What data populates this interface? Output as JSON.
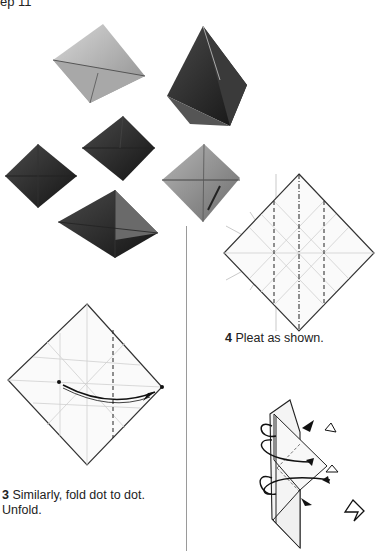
{
  "header": {
    "fragment": "ep 11"
  },
  "photos": {
    "alt_items": [
      "light-foil-octahedron",
      "dark-tall-pyramid",
      "dark-small-octahedron-left",
      "dark-small-octahedron-center",
      "grey-octahedron-right",
      "dark-large-octahedron-bottom"
    ]
  },
  "steps": [
    {
      "number": "3",
      "text": "Similarly, fold dot to dot.",
      "text2": "Unfold."
    },
    {
      "number": "4",
      "text": "Pleat as shown."
    }
  ],
  "colors": {
    "line": "#333333",
    "crease": "#aaaaaa",
    "divider": "#9a9a9a"
  }
}
